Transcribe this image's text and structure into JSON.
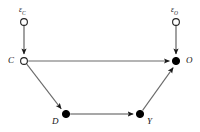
{
  "figure": {
    "type": "causal-dag",
    "background_color": "#ffffff",
    "stroke_color": "#3a3a3a",
    "filled_node_color": "#000000",
    "hollow_node_fill": "#ffffff",
    "hollow_node_stroke": "#222222",
    "width": 200,
    "height": 132
  },
  "nodes": [
    {
      "id": "epsC",
      "label": "ε",
      "subscript": "C",
      "style": "hollow",
      "x": 24,
      "y": 22,
      "r": 3.4,
      "label_x": 19,
      "label_y": 6
    },
    {
      "id": "epsO",
      "label": "ε",
      "subscript": "O",
      "style": "hollow",
      "x": 176,
      "y": 22,
      "r": 3.4,
      "label_x": 171,
      "label_y": 6
    },
    {
      "id": "C",
      "label": "C",
      "style": "hollow",
      "x": 24,
      "y": 61,
      "r": 3.4,
      "label_x": 8,
      "label_y": 56
    },
    {
      "id": "O",
      "label": "O",
      "style": "filled",
      "x": 176,
      "y": 61,
      "r": 3.6,
      "label_x": 186,
      "label_y": 56
    },
    {
      "id": "D",
      "label": "D",
      "style": "filled",
      "x": 66,
      "y": 114,
      "r": 3.6,
      "label_x": 52,
      "label_y": 117
    },
    {
      "id": "Y",
      "label": "Y",
      "style": "filled",
      "x": 140,
      "y": 114,
      "r": 3.6,
      "label_x": 147,
      "label_y": 117
    }
  ],
  "edges": [
    {
      "id": "epsC-C",
      "from": "epsC",
      "to": "C",
      "arrow": true
    },
    {
      "id": "epsO-O",
      "from": "epsO",
      "to": "O",
      "arrow": true
    },
    {
      "id": "C-O",
      "from": "C",
      "to": "O",
      "arrow": true
    },
    {
      "id": "C-D",
      "from": "C",
      "to": "D",
      "arrow": true
    },
    {
      "id": "D-Y",
      "from": "D",
      "to": "Y",
      "arrow": true
    },
    {
      "id": "Y-O",
      "from": "Y",
      "to": "O",
      "arrow": true
    }
  ]
}
